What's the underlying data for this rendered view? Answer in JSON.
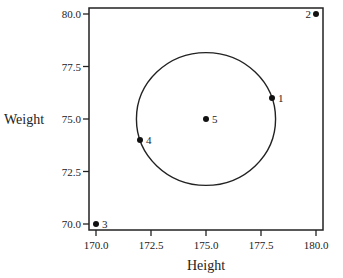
{
  "chart_data": {
    "type": "scatter",
    "title": "",
    "xlabel": "Height",
    "ylabel": "Weight",
    "xlim": [
      169.7,
      180.3
    ],
    "ylim": [
      69.8,
      80.3
    ],
    "xticks": [
      170.0,
      172.5,
      175.0,
      177.5,
      180.0
    ],
    "xtick_labels": [
      "170.0",
      "172.5",
      "175.0",
      "177.5",
      "180.0"
    ],
    "yticks": [
      70.0,
      72.5,
      75.0,
      77.5,
      80.0
    ],
    "ytick_labels": [
      "70.0",
      "72.5",
      "75.0",
      "77.5",
      "80.0"
    ],
    "grid": false,
    "points": [
      {
        "label": "1",
        "x": 178,
        "y": 76,
        "label_side": "right"
      },
      {
        "label": "2",
        "x": 180,
        "y": 80,
        "label_side": "left"
      },
      {
        "label": "3",
        "x": 170,
        "y": 70,
        "label_side": "right"
      },
      {
        "label": "4",
        "x": 172,
        "y": 74,
        "label_side": "right"
      },
      {
        "label": "5",
        "x": 175,
        "y": 75,
        "label_side": "right"
      }
    ],
    "circle": {
      "center_x": 175,
      "center_y": 75,
      "radius": 3.1623
    }
  }
}
